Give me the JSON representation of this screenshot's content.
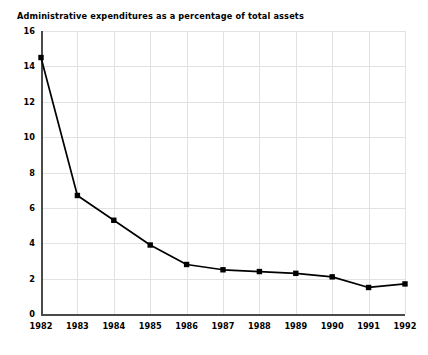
{
  "chart_data": {
    "type": "line",
    "title": "Administrative expenditures as a percentage of total assets",
    "xlabel": "",
    "ylabel": "",
    "categories": [
      "1982",
      "1983",
      "1984",
      "1985",
      "1986",
      "1987",
      "1988",
      "1989",
      "1990",
      "1991",
      "1992"
    ],
    "x": [
      1982,
      1983,
      1984,
      1985,
      1986,
      1987,
      1988,
      1989,
      1990,
      1991,
      1992
    ],
    "values": [
      14.5,
      6.7,
      5.3,
      3.9,
      2.8,
      2.5,
      2.4,
      2.3,
      2.1,
      1.5,
      1.7
    ],
    "series": [
      {
        "name": "Administrative expenditures as a percentage of total assets",
        "values": [
          14.5,
          6.7,
          5.3,
          3.9,
          2.8,
          2.5,
          2.4,
          2.3,
          2.1,
          1.5,
          1.7
        ]
      }
    ],
    "ylim": [
      0,
      16
    ],
    "yticks": [
      0,
      2,
      4,
      6,
      8,
      10,
      12,
      14,
      16
    ],
    "ytick_labels": [
      "0",
      "2",
      "4",
      "6",
      "8",
      "10",
      "12",
      "14",
      "16"
    ],
    "xlim": [
      1982,
      1992
    ],
    "grid": true,
    "grid_color": "#e2e2e2",
    "legend": false,
    "legend_position": "none",
    "line_color": "#000000",
    "marker": "square",
    "marker_color": "#000000",
    "background_color": "#ffffff",
    "axis_color": "#4a4a4a"
  }
}
